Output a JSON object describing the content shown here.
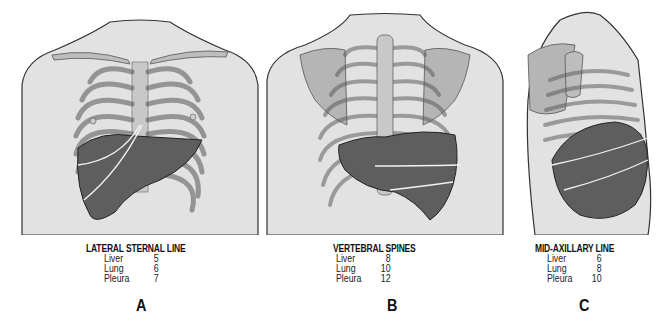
{
  "figure": {
    "panels": [
      {
        "id": "A",
        "letter": "A",
        "title": "LATERAL STERNAL LINE",
        "view": "anterior",
        "rows": [
          {
            "organ": "Liver",
            "value": "5"
          },
          {
            "organ": "Lung",
            "value": "6"
          },
          {
            "organ": "Pleura",
            "value": "7"
          }
        ]
      },
      {
        "id": "B",
        "letter": "B",
        "title": "VERTEBRAL SPINES",
        "view": "posterior",
        "rows": [
          {
            "organ": "Liver",
            "value": "8"
          },
          {
            "organ": "Lung",
            "value": "10"
          },
          {
            "organ": "Pleura",
            "value": "12"
          }
        ]
      },
      {
        "id": "C",
        "letter": "C",
        "title": "MID-AXILLARY LINE",
        "view": "lateral",
        "rows": [
          {
            "organ": "Liver",
            "value": "6"
          },
          {
            "organ": "Lung",
            "value": "8"
          },
          {
            "organ": "Pleura",
            "value": "10"
          }
        ]
      }
    ],
    "colors": {
      "skin": "#e2e2e2",
      "bone": "#bdbdbd",
      "bone_outline": "#555555",
      "liver": "#5e5e5e",
      "outline": "#222222",
      "text": "#111111"
    }
  }
}
